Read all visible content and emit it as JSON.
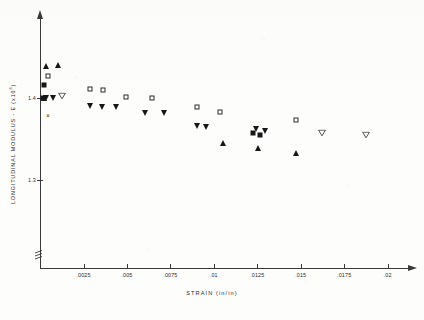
{
  "chart_data": {
    "type": "scatter",
    "title": "",
    "xlabel": "STRAIN (in/in)",
    "ylabel": "LONGITUDINAL MODULUS - E  (x10",
    "ylabel_exponent": "6",
    "ylabel_close": ")",
    "xlim": [
      0,
      0.021
    ],
    "ylim": [
      1.25,
      1.47
    ],
    "grid": false,
    "legend": "none",
    "axis_break_y": true,
    "xticks": [
      0.0025,
      0.005,
      0.0075,
      0.01,
      0.0125,
      0.015,
      0.0175,
      0.02
    ],
    "xtick_labels": [
      ".0025",
      ".005",
      ".0075",
      ".01",
      ".0125",
      ".015",
      ".0175",
      ".02"
    ],
    "yticks": [
      1.4,
      1.3
    ],
    "ytick_labels": [
      "1.4",
      "1.3"
    ],
    "series": [
      {
        "name": "filled-triangle-down",
        "marker": "tri-down-filled",
        "points": [
          {
            "x": 0.00035,
            "y": 1.4005
          },
          {
            "x": 0.00075,
            "y": 1.3995
          },
          {
            "x": 0.00285,
            "y": 1.3905
          },
          {
            "x": 0.00355,
            "y": 1.3885
          },
          {
            "x": 0.00435,
            "y": 1.3895
          },
          {
            "x": 0.00605,
            "y": 1.3815
          },
          {
            "x": 0.00715,
            "y": 1.3815
          },
          {
            "x": 0.00905,
            "y": 1.3655
          },
          {
            "x": 0.00955,
            "y": 1.3645
          },
          {
            "x": 0.01245,
            "y": 1.3625
          },
          {
            "x": 0.01295,
            "y": 1.3595
          }
        ]
      },
      {
        "name": "open-square",
        "marker": "square-open",
        "points": [
          {
            "x": 0.00045,
            "y": 1.4265
          },
          {
            "x": 0.00285,
            "y": 1.4105
          },
          {
            "x": 0.00365,
            "y": 1.4095
          },
          {
            "x": 0.00495,
            "y": 1.4015
          },
          {
            "x": 0.00645,
            "y": 1.3995
          },
          {
            "x": 0.00905,
            "y": 1.3895
          },
          {
            "x": 0.01035,
            "y": 1.3835
          },
          {
            "x": 0.01475,
            "y": 1.3735
          }
        ]
      },
      {
        "name": "filled-square",
        "marker": "square-filled",
        "points": [
          {
            "x": 0.00025,
            "y": 1.4165
          },
          {
            "x": 0.00015,
            "y": 1.4005
          },
          {
            "x": 0.01225,
            "y": 1.3575
          },
          {
            "x": 0.01265,
            "y": 1.3555
          }
        ]
      },
      {
        "name": "filled-triangle-up",
        "marker": "tri-up-filled",
        "points": [
          {
            "x": 0.00035,
            "y": 1.4395
          },
          {
            "x": 0.00105,
            "y": 1.4405
          },
          {
            "x": 0.00025,
            "y": 1.3995
          },
          {
            "x": 0.01055,
            "y": 1.3455
          },
          {
            "x": 0.01255,
            "y": 1.3385
          },
          {
            "x": 0.01475,
            "y": 1.3335
          }
        ]
      },
      {
        "name": "open-triangle-down",
        "marker": "tri-down-open",
        "points": [
          {
            "x": 0.00125,
            "y": 1.4025
          },
          {
            "x": 0.01625,
            "y": 1.3575
          },
          {
            "x": 0.01875,
            "y": 1.3545
          }
        ]
      },
      {
        "name": "x-marker",
        "marker": "x",
        "points": [
          {
            "x": 0.00045,
            "y": 1.3775
          }
        ]
      }
    ]
  }
}
